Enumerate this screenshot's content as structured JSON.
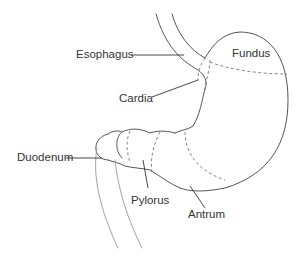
{
  "diagram": {
    "labels": [
      {
        "id": "esophagus",
        "text": "Esophagus"
      },
      {
        "id": "fundus",
        "text": "Fundus"
      },
      {
        "id": "cardia",
        "text": "Cardia"
      },
      {
        "id": "duodenum",
        "text": "Duodenum"
      },
      {
        "id": "pylorus",
        "text": "Pylorus"
      },
      {
        "id": "antrum",
        "text": "Antrum"
      }
    ],
    "colors": {
      "outline": "#555555",
      "dashed": "#777777",
      "leader": "#333333",
      "text": "#333333"
    }
  }
}
